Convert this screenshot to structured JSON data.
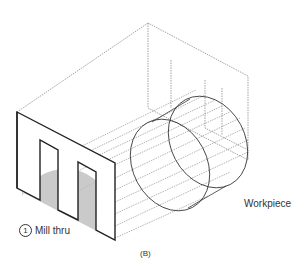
{
  "figure": {
    "caption": "(B)",
    "step": {
      "number": "1",
      "label": "Mill thru"
    },
    "workpiece_label": "Workpiece",
    "colors": {
      "line": "#222222",
      "dashed": "#555555",
      "shade": "#bdbdbd",
      "text": "#333333"
    }
  }
}
